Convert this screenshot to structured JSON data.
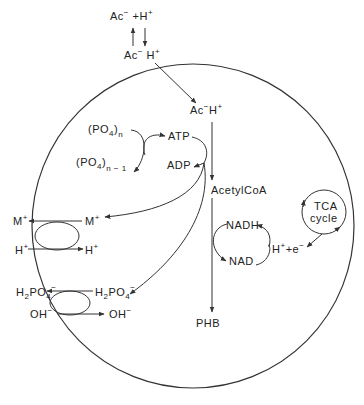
{
  "diagram": {
    "title": "",
    "outside": {
      "acetate_dissociated": {
        "base": "Ac",
        "sup1": "−",
        "plus": " +H",
        "sup2": "+"
      },
      "acetate_undissociated": {
        "base": "Ac",
        "sup1": "−",
        "mid": " H",
        "sup2": "+"
      }
    },
    "inside": {
      "acetate_undissociated": {
        "base": "Ac",
        "sup1": "−",
        "mid": "H",
        "sup2": "+"
      },
      "polyphosphate_n": {
        "base": "(PO",
        "sub": "4",
        "close": ")",
        "index": "n"
      },
      "polyphosphate_n_minus_1": {
        "base": "(PO",
        "sub": "4",
        "close": ")",
        "index": "n − 1"
      },
      "atp": "ATP",
      "adp": "ADP",
      "acetylcoa": "AcetylCoA",
      "phb": "PHB",
      "nadh": "NADH",
      "nad": "NAD",
      "h_plus_e": {
        "base": "H",
        "sup1": "+",
        "mid": "+e",
        "sup2": "−"
      },
      "tca_cycle": {
        "line1": "TCA",
        "line2": "cycle"
      }
    },
    "transporters": [
      {
        "name": "cation-proton-antiporter",
        "out_top": {
          "base": "M",
          "sup": "+"
        },
        "in_top": {
          "base": "M",
          "sup": "+"
        },
        "out_bottom": {
          "base": "H",
          "sup": "+"
        },
        "in_bottom": {
          "base": "H",
          "sup": "+"
        }
      },
      {
        "name": "phosphate-hydroxide-antiporter",
        "out_top": {
          "base": "H",
          "sub1": "2",
          "mid": "PO",
          "sub2": "4",
          "sup": "−"
        },
        "in_top": {
          "base": "H",
          "sub1": "2",
          "mid": "PO",
          "sub2": "4",
          "sup": "−"
        },
        "out_bottom": {
          "base": "OH",
          "sup": "−"
        },
        "in_bottom": {
          "base": "OH",
          "sup": "−"
        }
      }
    ],
    "colors": {
      "line": "#333333",
      "text": "#222222",
      "background": "#ffffff"
    }
  }
}
